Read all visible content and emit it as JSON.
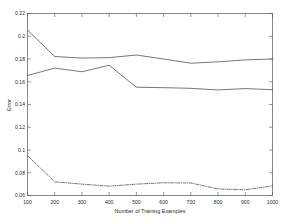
{
  "chart_data": {
    "type": "line",
    "title": "",
    "xlabel": "Number of Training Examples",
    "ylabel": "Error",
    "xlim": [
      100,
      1000
    ],
    "ylim": [
      0.06,
      0.22
    ],
    "grid": false,
    "legend": "none",
    "x": [
      100,
      200,
      300,
      400,
      500,
      600,
      700,
      800,
      900,
      1000
    ],
    "xticks": [
      "100",
      "200",
      "300",
      "400",
      "500",
      "600",
      "700",
      "800",
      "900",
      "1000"
    ],
    "yticks": [
      "0.06",
      "0.08",
      "0.1",
      "0.12",
      "0.14",
      "0.16",
      "0.18",
      "0.2",
      "0.22"
    ],
    "series": [
      {
        "name": "series-1",
        "style": "solid",
        "values": [
          0.2055,
          0.1822,
          0.1808,
          0.1812,
          0.1835,
          0.18,
          0.1763,
          0.1775,
          0.1792,
          0.18
        ]
      },
      {
        "name": "series-2",
        "style": "solid",
        "values": [
          0.1655,
          0.172,
          0.1688,
          0.1745,
          0.1552,
          0.1548,
          0.1542,
          0.1528,
          0.154,
          0.153
        ]
      },
      {
        "name": "series-3",
        "style": "dash-dot",
        "values": [
          0.095,
          0.072,
          0.07,
          0.0682,
          0.07,
          0.0712,
          0.071,
          0.0658,
          0.065,
          0.0685
        ]
      }
    ]
  },
  "figure": {
    "background_color": "#ffffff",
    "axis_color": "#555555",
    "line_color": "#4a4a4a"
  }
}
